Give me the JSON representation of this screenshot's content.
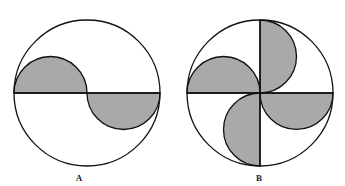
{
  "figure": {
    "colors": {
      "background": "#ffffff",
      "stroke": "#111111",
      "shade": "#a9a9a9"
    },
    "panels": [
      {
        "id": "A",
        "label": "A",
        "center": [
          87,
          93
        ],
        "radius": 73,
        "shaded_regions": [
          "semicircle on left radius, above diameter",
          "semicircle on right radius, below diameter"
        ]
      },
      {
        "id": "B",
        "label": "B",
        "center": [
          260,
          93
        ],
        "radius": 73,
        "shaded_regions": [
          "semicircle on left radius, above horizontal diameter",
          "semicircle on top radius, right of vertical diameter",
          "semicircle on right radius, below horizontal diameter",
          "semicircle on bottom radius, left of vertical diameter"
        ]
      }
    ]
  }
}
